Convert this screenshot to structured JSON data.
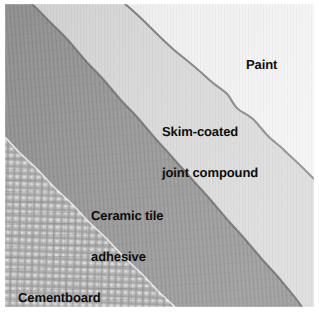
{
  "figure": {
    "background_color": "#ffffff",
    "plate": {
      "x": 5,
      "y": 4,
      "width": 309,
      "height": 303
    }
  },
  "layers": [
    {
      "id": "cementboard",
      "label": "Cementboard",
      "label_lines": [
        "Cementboard"
      ],
      "color": "#c5c5c5",
      "texture": "woven-mesh-crosshatch",
      "position": "bottom-left",
      "order": 1
    },
    {
      "id": "ceramic-tile-adhesive",
      "label": "Ceramic tile adhesive",
      "label_lines": [
        "Ceramic tile",
        "adhesive"
      ],
      "color": "#989898",
      "texture": "troweled-streak",
      "position": "lower-left-band",
      "order": 2
    },
    {
      "id": "skim-coated-joint-compound",
      "label": "Skim-coated joint compound",
      "label_lines": [
        "Skim-coated",
        "joint compound"
      ],
      "color": "#d7d7d7",
      "texture": "fine-vertical-grain",
      "position": "middle-band",
      "order": 3
    },
    {
      "id": "paint",
      "label": "Paint",
      "label_lines": [
        "Paint"
      ],
      "color": "#f1f1f1",
      "texture": "fine-vertical-grain",
      "position": "top-right",
      "order": 4
    }
  ],
  "labels": {
    "paint": "Paint",
    "skim_line1": "Skim-coated",
    "skim_line2": "joint compound",
    "adhesive_line1": "Ceramic tile",
    "adhesive_line2": "adhesive",
    "cementboard": "Cementboard",
    "text_color": "#0d0d0d"
  }
}
